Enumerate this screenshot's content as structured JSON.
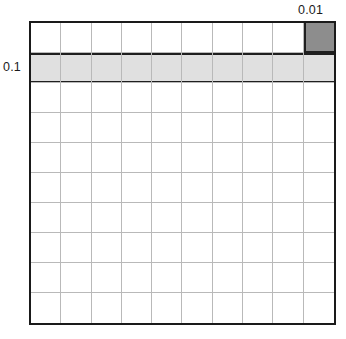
{
  "figure": {
    "type": "place-value-grid",
    "background_color": "#ffffff",
    "frame_color": "#1a1a1a",
    "gridline_color": "#b9b9b9"
  },
  "grid": {
    "columns": 10,
    "rows": 10,
    "total_cells": 100
  },
  "labels": {
    "hundredth": "0.01",
    "tenth": "0.1"
  },
  "highlights": [
    {
      "name": "hundredth-cell",
      "value": "0.01",
      "cells_shaded": 1,
      "fraction": "1/100",
      "color": "#8d8d8d",
      "row": 1,
      "column": 10
    },
    {
      "name": "tenth-row",
      "value": "0.1",
      "cells_shaded": 10,
      "fraction": "10/100",
      "color": "#e0e0e0",
      "row": 2,
      "column": "all"
    }
  ],
  "chart_data": {
    "type": "heatmap",
    "title": "",
    "xlabel": "",
    "ylabel": "",
    "categories": [
      "1",
      "2",
      "3",
      "4",
      "5",
      "6",
      "7",
      "8",
      "9",
      "10"
    ],
    "rows": [
      "1",
      "2",
      "3",
      "4",
      "5",
      "6",
      "7",
      "8",
      "9",
      "10"
    ],
    "values": [
      [
        0,
        0,
        0,
        0,
        0,
        0,
        0,
        0,
        0,
        2
      ],
      [
        1,
        1,
        1,
        1,
        1,
        1,
        1,
        1,
        1,
        1
      ],
      [
        0,
        0,
        0,
        0,
        0,
        0,
        0,
        0,
        0,
        0
      ],
      [
        0,
        0,
        0,
        0,
        0,
        0,
        0,
        0,
        0,
        0
      ],
      [
        0,
        0,
        0,
        0,
        0,
        0,
        0,
        0,
        0,
        0
      ],
      [
        0,
        0,
        0,
        0,
        0,
        0,
        0,
        0,
        0,
        0
      ],
      [
        0,
        0,
        0,
        0,
        0,
        0,
        0,
        0,
        0,
        0
      ],
      [
        0,
        0,
        0,
        0,
        0,
        0,
        0,
        0,
        0,
        0
      ],
      [
        0,
        0,
        0,
        0,
        0,
        0,
        0,
        0,
        0,
        0
      ],
      [
        0,
        0,
        0,
        0,
        0,
        0,
        0,
        0,
        0,
        0
      ]
    ],
    "legend": [
      {
        "level": 0,
        "color": "#ffffff",
        "meaning": "unshaded"
      },
      {
        "level": 1,
        "color": "#e0e0e0",
        "meaning": "0.1"
      },
      {
        "level": 2,
        "color": "#8d8d8d",
        "meaning": "0.01"
      }
    ],
    "annotations": [
      {
        "text": "0.01",
        "position": "above-top-right"
      },
      {
        "text": "0.1",
        "position": "left-of-row-2"
      }
    ],
    "grid": true,
    "legend_position": "none"
  }
}
